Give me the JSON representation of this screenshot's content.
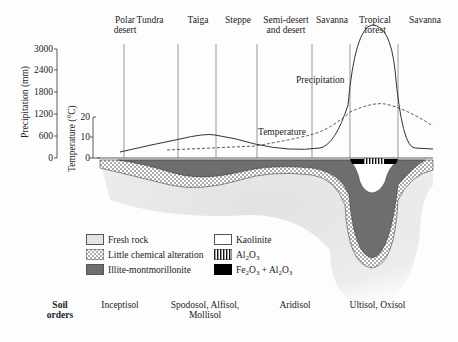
{
  "diagram": {
    "biomes": [
      {
        "label": "Polar\ndesert",
        "line1": "Polar",
        "line2": "desert"
      },
      {
        "label": "Tundra"
      },
      {
        "label": "Taiga"
      },
      {
        "label": "Steppe"
      },
      {
        "label": "Semi-desert and desert",
        "line1": "Semi-desert",
        "line2": "and desert"
      },
      {
        "label": "Savanna"
      },
      {
        "label": "Tropical forest",
        "line1": "Tropical",
        "line2": "forest"
      },
      {
        "label": "Savanna"
      }
    ],
    "precip_axis": {
      "title": "Precipitation (mm)",
      "ticks": [
        "3000",
        "2400",
        "1800",
        "1200",
        "600",
        "0"
      ]
    },
    "temp_axis": {
      "title": "Temperature (°C)",
      "ticks": [
        "20",
        "10",
        "0"
      ]
    },
    "curve_labels": {
      "precipitation": "Precipitation",
      "temperature": "Temperature"
    },
    "legend": [
      {
        "label": "Fresh rock",
        "swatch": "fresh-rock",
        "color": "#e4e4e4"
      },
      {
        "label": "Little chemical alteration",
        "swatch": "dotted",
        "color": "#ffffff"
      },
      {
        "label": "Illite-montmorillonite",
        "swatch": "dark-gray",
        "color": "#6e6e6e"
      },
      {
        "label": "Kaolinite",
        "swatch": "white",
        "color": "#ffffff"
      },
      {
        "label_main": "Al",
        "sub1": "2",
        "mid": "O",
        "sub2": "3",
        "swatch": "vertical-stripes"
      },
      {
        "label_a": "Fe",
        "sub_a1": "2",
        "label_b": "O",
        "sub_a2": "3",
        "label_c": " + Al",
        "sub_b1": "2",
        "label_d": "O",
        "sub_b2": "3",
        "swatch": "black",
        "color": "#000000"
      }
    ],
    "soil_orders": {
      "title_line1": "Soil",
      "title_line2": "orders",
      "items": [
        {
          "line1": "Inceptisol"
        },
        {
          "line1": "Spodosol, Alfisol,",
          "line2": "Mollisol"
        },
        {
          "line1": "Aridisol"
        },
        {
          "line1": "Ultisol, Oxisol"
        }
      ]
    }
  }
}
